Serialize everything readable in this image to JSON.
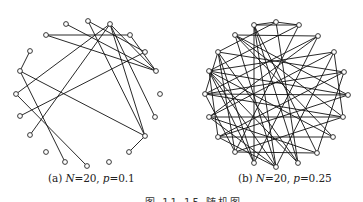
{
  "figure": {
    "subfigures": [
      {
        "id": "a",
        "label": "(a)",
        "caption_text": "(a) N=20, p=0.1",
        "caption_parts": {
          "prefix": "(a) ",
          "n_var": "N",
          "n_eq": "=20, ",
          "p_var": "p",
          "p_eq": "=0.1"
        },
        "N": 20,
        "p": 0.1,
        "nodes": [
          [
            88,
            21
          ],
          [
            110,
            24
          ],
          [
            130,
            35
          ],
          [
            145,
            52
          ],
          [
            156,
            71
          ],
          [
            160,
            94
          ],
          [
            155,
            117
          ],
          [
            145,
            136
          ],
          [
            129,
            152
          ],
          [
            109,
            162
          ],
          [
            87,
            166
          ],
          [
            65,
            162
          ],
          [
            46,
            152
          ],
          [
            30,
            135
          ],
          [
            20,
            116
          ],
          [
            16,
            94
          ],
          [
            20,
            71
          ],
          [
            30,
            51
          ],
          [
            46,
            35
          ],
          [
            66,
            24
          ]
        ],
        "edges": [
          [
            18,
            2
          ],
          [
            18,
            4
          ],
          [
            19,
            4
          ],
          [
            1,
            4
          ],
          [
            1,
            15
          ],
          [
            1,
            13
          ],
          [
            1,
            7
          ],
          [
            1,
            6
          ],
          [
            0,
            7
          ],
          [
            0,
            3
          ],
          [
            3,
            14
          ],
          [
            17,
            16
          ],
          [
            16,
            7
          ],
          [
            16,
            11
          ],
          [
            15,
            10
          ],
          [
            7,
            8
          ],
          [
            2,
            4
          ]
        ]
      },
      {
        "id": "b",
        "label": "(b)",
        "caption_text": "(b) N=20, p=0.25",
        "caption_parts": {
          "prefix": "(b) ",
          "n_var": "N",
          "n_eq": "=20, ",
          "p_var": "p",
          "p_eq": "=0.25"
        },
        "N": 20,
        "p": 0.25,
        "nodes": [
          [
            276,
            22
          ],
          [
            299,
            25
          ],
          [
            318,
            36
          ],
          [
            334,
            52
          ],
          [
            344,
            72
          ],
          [
            348,
            95
          ],
          [
            343,
            117
          ],
          [
            333,
            137
          ],
          [
            317,
            153
          ],
          [
            298,
            163
          ],
          [
            276,
            167
          ],
          [
            254,
            163
          ],
          [
            235,
            152
          ],
          [
            218,
            137
          ],
          [
            209,
            117
          ],
          [
            205,
            94
          ],
          [
            209,
            71
          ],
          [
            218,
            52
          ],
          [
            235,
            35
          ],
          [
            254,
            25
          ]
        ],
        "edges": [
          [
            0,
            19
          ],
          [
            0,
            1
          ],
          [
            0,
            9
          ],
          [
            0,
            17
          ],
          [
            1,
            19
          ],
          [
            1,
            12
          ],
          [
            1,
            16
          ],
          [
            2,
            18
          ],
          [
            2,
            11
          ],
          [
            2,
            15
          ],
          [
            3,
            16
          ],
          [
            3,
            6
          ],
          [
            3,
            10
          ],
          [
            4,
            17
          ],
          [
            4,
            15
          ],
          [
            4,
            8
          ],
          [
            5,
            15
          ],
          [
            5,
            13
          ],
          [
            6,
            14
          ],
          [
            6,
            12
          ],
          [
            7,
            13
          ],
          [
            7,
            18
          ],
          [
            7,
            16
          ],
          [
            8,
            14
          ],
          [
            8,
            12
          ],
          [
            8,
            19
          ],
          [
            9,
            19
          ],
          [
            9,
            16
          ],
          [
            10,
            18
          ],
          [
            10,
            14
          ],
          [
            11,
            16
          ],
          [
            11,
            17
          ],
          [
            11,
            19
          ],
          [
            12,
            15
          ],
          [
            12,
            17
          ],
          [
            13,
            4
          ],
          [
            13,
            16
          ],
          [
            14,
            2
          ],
          [
            15,
            17
          ],
          [
            15,
            6
          ],
          [
            16,
            5
          ],
          [
            17,
            9
          ],
          [
            18,
            6
          ],
          [
            19,
            10
          ],
          [
            13,
            10
          ],
          [
            18,
            5
          ],
          [
            14,
            3
          ],
          [
            16,
            10
          ]
        ]
      }
    ],
    "main_caption": "图 11.15   随机图",
    "colors": {
      "edge": "#111111",
      "node_fill": "#ffffff",
      "node_stroke": "#222222",
      "background": "#ffffff"
    }
  }
}
